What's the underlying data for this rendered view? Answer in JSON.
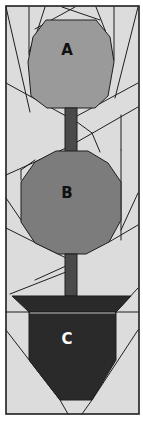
{
  "diagram": {
    "canvas": {
      "width": 143,
      "height": 422
    },
    "colors": {
      "background": "#dcdcdc",
      "seam": "#1e1e1e",
      "piece_a": "#9a9a9a",
      "piece_b": "#7c7c7c",
      "stem": "#4a4a4a",
      "pot": "#2a2a2a",
      "rim_highlight": "#bdbdbd",
      "label_dark": "#111111",
      "label_light": "#ffffff"
    },
    "pieces": [
      {
        "id": "A",
        "label": "A",
        "shape": "octagon",
        "label_pos": [
          67,
          50
        ]
      },
      {
        "id": "B",
        "label": "B",
        "shape": "octagon",
        "label_pos": [
          67,
          193
        ]
      },
      {
        "id": "C",
        "label": "C",
        "shape": "pot",
        "label_pos": [
          67,
          339
        ]
      }
    ],
    "labels": {
      "a": "A",
      "b": "B",
      "c": "C"
    }
  }
}
